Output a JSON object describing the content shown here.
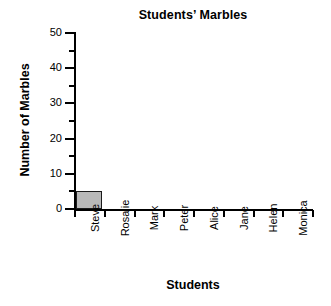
{
  "chart_data": {
    "type": "bar",
    "title": "Students’ Marbles",
    "xlabel": "Students",
    "ylabel": "Number of Marbles",
    "categories": [
      "Steve",
      "Rosalie",
      "Mark",
      "Peter",
      "Alice",
      "Jane",
      "Helen",
      "Monica"
    ],
    "values": [
      5,
      0,
      0,
      0,
      0,
      0,
      0,
      0
    ],
    "ylim": [
      0,
      50
    ],
    "y_major_ticks": [
      0,
      10,
      20,
      30,
      40,
      50
    ],
    "y_minor_ticks": [
      5,
      15,
      25,
      35,
      45
    ],
    "y_tick_labels": [
      "0",
      "10",
      "20",
      "30",
      "40",
      "50"
    ],
    "grid": false,
    "legend": "none",
    "bar_color": "#b8b8b8",
    "bar_edge_color": "#1a1a1a",
    "axis_color": "#000000",
    "background_color": "#ffffff"
  }
}
